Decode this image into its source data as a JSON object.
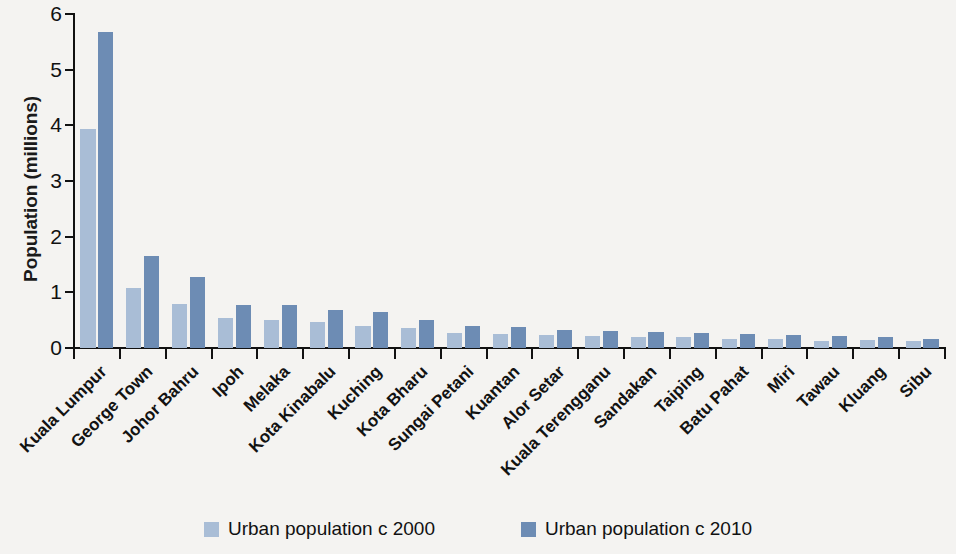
{
  "chart_data": {
    "type": "bar",
    "title": "",
    "xlabel": "",
    "ylabel": "Population (millions)",
    "ylim": [
      0,
      6
    ],
    "yticks": [
      0,
      1,
      2,
      3,
      4,
      5,
      6
    ],
    "ytick_labels": [
      "0",
      "1",
      "2",
      "3",
      "4",
      "5",
      "6"
    ],
    "grid": false,
    "legend_position": "bottom-center",
    "categories": [
      "Kuala Lumpur",
      "George Town",
      "Johor Bahru",
      "Ipoh",
      "Melaka",
      "Kota Kinabalu",
      "Kuching",
      "Kota Bharu",
      "Sungai Petani",
      "Kuantan",
      "Alor Setar",
      "Kuala Terengganu",
      "Sandakan",
      "Taiping",
      "Batu Pahat",
      "Miri",
      "Tawau",
      "Kluang",
      "Sibu"
    ],
    "series": [
      {
        "name": "Urban population c 2000",
        "color": "#a9bdd6",
        "values": [
          3.93,
          1.08,
          0.79,
          0.54,
          0.51,
          0.47,
          0.4,
          0.36,
          0.27,
          0.25,
          0.24,
          0.22,
          0.2,
          0.19,
          0.17,
          0.16,
          0.13,
          0.15,
          0.13
        ]
      },
      {
        "name": "Urban population c 2010",
        "color": "#6d8cb4",
        "values": [
          5.67,
          1.66,
          1.27,
          0.77,
          0.77,
          0.69,
          0.65,
          0.51,
          0.39,
          0.38,
          0.32,
          0.31,
          0.28,
          0.27,
          0.26,
          0.24,
          0.22,
          0.19,
          0.17
        ]
      }
    ]
  },
  "legend": {
    "items": [
      {
        "label": "Urban population c 2000",
        "color": "#a9bdd6"
      },
      {
        "label": "Urban population c 2010",
        "color": "#6d8cb4"
      }
    ]
  },
  "axes": {
    "y_title": "Population (millions)"
  }
}
